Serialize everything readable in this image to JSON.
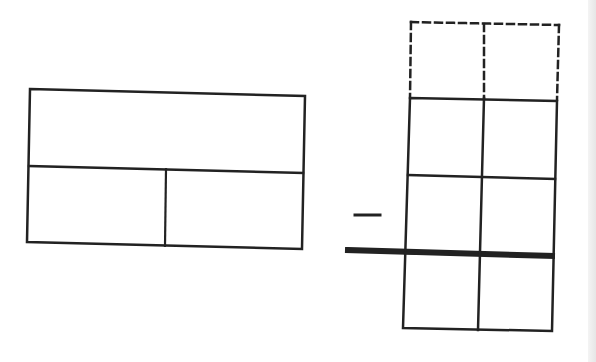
{
  "diagram": {
    "stroke_color": "#222222",
    "background": "#ffffff",
    "left_figure": {
      "outer": [
        [
          30,
          89
        ],
        [
          305,
          96
        ],
        [
          302,
          249
        ],
        [
          27,
          242
        ]
      ],
      "middle_line": [
        [
          29,
          166
        ],
        [
          303,
          173
        ]
      ],
      "divider": [
        [
          166,
          169
        ],
        [
          165,
          246
        ]
      ]
    },
    "operator": {
      "symbol": "minus",
      "line": [
        [
          355,
          215
        ],
        [
          380,
          215
        ]
      ]
    },
    "subtraction_bar": [
      [
        348,
        250
      ],
      [
        552,
        256
      ]
    ],
    "right_figure": {
      "dashed_top": {
        "left": [
          [
            411,
            22
          ],
          [
            410,
            98
          ]
        ],
        "middle": [
          [
            484,
            24
          ],
          [
            484,
            98
          ]
        ],
        "right": [
          [
            559,
            25
          ],
          [
            557,
            100
          ]
        ],
        "top": [
          [
            411,
            22
          ],
          [
            559,
            25
          ]
        ]
      },
      "solid_grid": {
        "outer": [
          [
            410,
            98
          ],
          [
            557,
            101
          ],
          [
            552,
            331
          ],
          [
            403,
            328
          ]
        ],
        "row_lines": [
          [
            [
              408,
              175
            ],
            [
              555,
              179
            ]
          ],
          [
            [
              405,
              253
            ],
            [
              553,
              256
            ]
          ]
        ],
        "column_line": [
          [
            484,
            98
          ],
          [
            478,
            330
          ]
        ]
      }
    }
  }
}
